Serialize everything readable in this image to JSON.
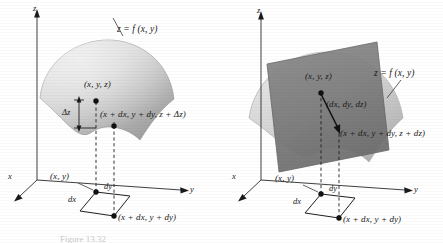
{
  "figure": {
    "caption": "Figure  13.32",
    "panel_count": 2
  },
  "colors": {
    "ink": "#1a1a1a",
    "surface_light": "#d8d8d8",
    "surface_mid": "#b9b9b9",
    "surface_dark": "#9a9a9a",
    "tangent_plane": "#7a7a7a",
    "background": "#ffffff"
  },
  "panels": [
    {
      "id": "left",
      "name": "actual-increment-panel",
      "axes": {
        "x": "x",
        "y": "y",
        "z": "z"
      },
      "surface_label": "z = f (x, y)",
      "labels": {
        "point_on_surface": "(x, y, z)",
        "delta_z": "Δz",
        "second_point": "(x + dx, y + dy, z + Δz)",
        "base_point": "(x, y)",
        "dx": "dx",
        "dy": "dy",
        "base_corner": "(x + dx, y + dy)"
      }
    },
    {
      "id": "right",
      "name": "tangent-plane-panel",
      "axes": {
        "x": "x",
        "y": "y",
        "z": "z"
      },
      "surface_label": "z = f (x, y)",
      "labels": {
        "point_on_surface": "(x, y, z)",
        "differential_vector": "(dx, dy, dz)",
        "second_point": "(x + dx, y + dy, z + dz)",
        "base_point": "(x, y)",
        "dx": "dx",
        "dy": "dy",
        "base_corner": "(x + dx, y + dy)"
      }
    }
  ]
}
